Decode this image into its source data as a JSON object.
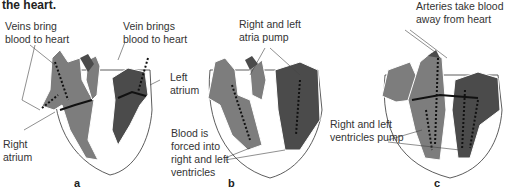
{
  "caption_fragment": "the heart.",
  "colors": {
    "right_side": "#7d7d7d",
    "left_side": "#4b4b4b",
    "outline": "#333333",
    "background": "#ffffff"
  },
  "panels": [
    {
      "letter": "a",
      "labels": {
        "veins": "Veins bring\nblood to heart",
        "vein": "Vein brings\nblood to heart",
        "left_atrium": "Left\natrium",
        "right_atrium": "Right\natrium"
      }
    },
    {
      "letter": "b",
      "labels": {
        "atria_pump": "Right and left\natria pump",
        "forced": "Blood is\nforced into\nright and left\nventricles"
      }
    },
    {
      "letter": "c",
      "labels": {
        "arteries": "Arteries take blood\naway from heart",
        "ventricles_pump": "Right and left\nventricles pump"
      }
    }
  ]
}
